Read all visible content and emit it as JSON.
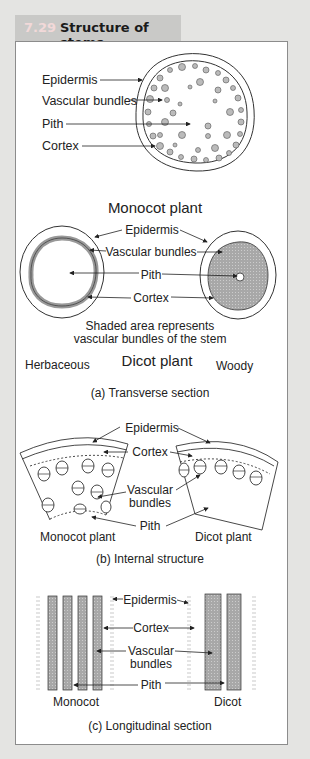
{
  "figure": {
    "number": "7.29",
    "title": "Structure of stems"
  },
  "transverse": {
    "monocot_labels": [
      "Epidermis",
      "Vascular bundles",
      "Pith",
      "Cortex"
    ],
    "monocot_caption": "Monocot plant",
    "dicot_labels": {
      "epidermis": "Epidermis",
      "vascular": "Vascular bundles",
      "pith": "Pith",
      "cortex": "Cortex"
    },
    "note_line1": "Shaded area represents",
    "note_line2": "vascular bundles of the stem",
    "dicot_caption": "Dicot plant",
    "herbaceous": "Herbaceous",
    "woody": "Woody",
    "section_caption": "(a) Transverse section"
  },
  "internal": {
    "epidermis": "Epidermis",
    "cortex": "Cortex",
    "vascular_line1": "Vascular",
    "vascular_line2": "bundles",
    "pith": "Pith",
    "monocot": "Monocot plant",
    "dicot": "Dicot plant",
    "section_caption": "(b) Internal structure"
  },
  "longitudinal": {
    "epidermis": "Epidermis",
    "cortex": "Cortex",
    "vascular_line1": "Vascular",
    "vascular_line2": "bundles",
    "pith": "Pith",
    "monocot": "Monocot",
    "dicot": "Dicot",
    "section_caption": "(c) Longitudinal section"
  },
  "colors": {
    "background": "#e4e4e2",
    "title_tab": "#c9c9c7",
    "panel_border": "#8c8c8c",
    "shading": "#a8a8a8"
  }
}
